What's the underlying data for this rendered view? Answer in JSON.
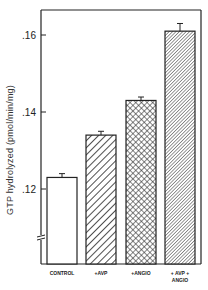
{
  "chart_data": {
    "type": "bar",
    "title": "",
    "xlabel": "",
    "ylabel": "GTP hydrolyzed (pmol/min/mg)",
    "categories": [
      "CONTROL",
      "+AVP",
      "+ANGIO",
      "+ AVP + ANGIO"
    ],
    "category_lines": [
      [
        "CONTROL"
      ],
      [
        "+AVP"
      ],
      [
        "+ANGIO"
      ],
      [
        "+ AVP +",
        "ANGIO"
      ]
    ],
    "values": [
      0.123,
      0.134,
      0.143,
      0.161
    ],
    "errors": [
      0.0006,
      0.0006,
      0.0005,
      0.0016
    ],
    "patterns": [
      "none",
      "wide-diagonal-hatch",
      "crosshatch",
      "fine-diagonal-hatch"
    ],
    "yticks": [
      ".12",
      ".14",
      ".16"
    ],
    "ytick_values": [
      0.12,
      0.14,
      0.16
    ],
    "ylim": [
      0.1,
      0.172
    ],
    "axis_break": true,
    "grid": false,
    "legend": "none",
    "colors": {
      "ink": "#222222",
      "fill": "#ffffff"
    }
  }
}
